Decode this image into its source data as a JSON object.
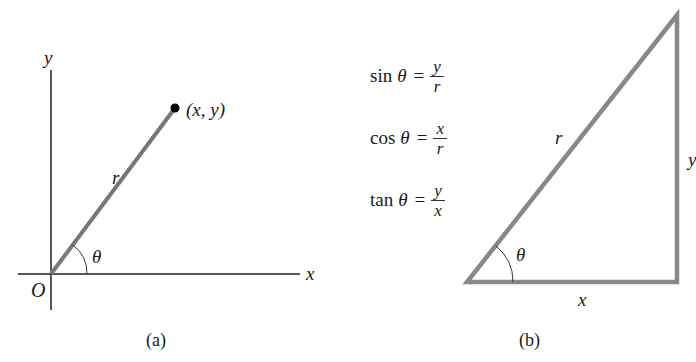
{
  "figure": {
    "panel_a": {
      "caption": "(a)",
      "axis_x_label": "x",
      "axis_y_label": "y",
      "origin_label": "O",
      "radius_label": "r",
      "angle_label": "θ",
      "point_label": "(x, y)"
    },
    "panel_b": {
      "caption": "(b)",
      "hypotenuse_label": "r",
      "adjacent_label": "x",
      "opposite_label": "y",
      "angle_label": "θ",
      "equations": [
        {
          "fn": "sin",
          "var": "θ",
          "equals": "=",
          "numerator": "y",
          "denominator": "r"
        },
        {
          "fn": "cos",
          "var": "θ",
          "equals": "=",
          "numerator": "x",
          "denominator": "r"
        },
        {
          "fn": "tan",
          "var": "θ",
          "equals": "=",
          "numerator": "y",
          "denominator": "x"
        }
      ]
    },
    "colors": {
      "axis": "#222222",
      "segment": "#777777",
      "point": "#000000"
    }
  }
}
